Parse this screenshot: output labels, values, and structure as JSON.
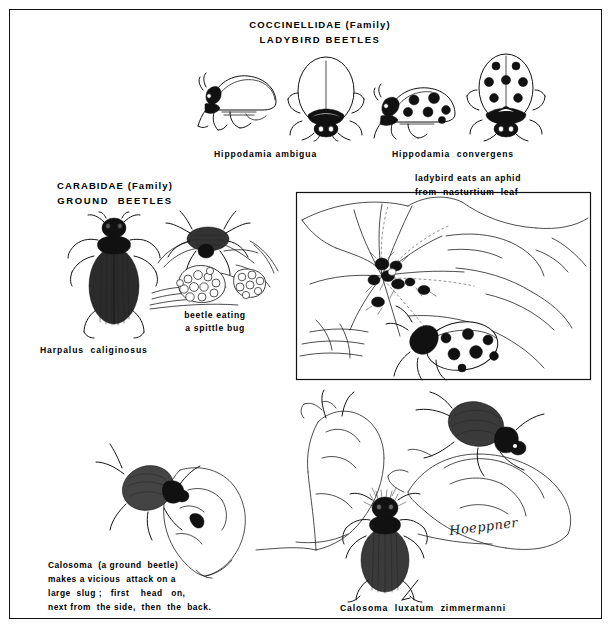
{
  "plate": {
    "medium": "pen-and-ink natural history illustration plate",
    "background_color": "#ffffff",
    "ink_color": "#111111",
    "border": "thin black rectangular frame"
  },
  "headings": {
    "coccinellidae": "COCCINELLIDAE (Family)",
    "ladybird_beetles": "LADYBIRD BEETLES",
    "carabidae": "CARABIDAE (Family)",
    "ground_beetles": "GROUND  BEETLES"
  },
  "species_labels": {
    "hippodamia_ambigua": "Hippodamia ambigua",
    "hippodamia_convergens": "Hippodamia  convergens",
    "harpalus": "Harpalus  caliginosus",
    "calosoma_species": "Calosoma  luxatum  zimmermanni"
  },
  "captions": {
    "aphid_line1": "ladybird eats an aphid",
    "aphid_line2": "from  nasturtium  leaf",
    "spittle_line1": "beetle eating",
    "spittle_line2": "a spittle bug",
    "calosoma_line1": "Calosoma  (a ground  beetle)",
    "calosoma_line2": "makes a vicious  attack on a",
    "calosoma_line3": "large  slug ;   first    head   on,",
    "calosoma_line4": "next from  the side,  then  the  back."
  },
  "signature": {
    "artist": "Hoeppner"
  },
  "figures": [
    {
      "name": "ladybird-lateral-plain",
      "description": "ladybird beetle side view, unspotted elytra, dark head markings"
    },
    {
      "name": "ladybird-dorsal-convergent",
      "description": "ladybird beetle dorsal view, black pronotum, plain elytra with midline"
    },
    {
      "name": "ladybird-lateral-spotted",
      "description": "ladybird beetle side view with large black spots"
    },
    {
      "name": "ladybird-dorsal-spotted",
      "description": "ladybird beetle dorsal view with large black spots"
    },
    {
      "name": "harpalus-dorsal",
      "description": "ground beetle Harpalus caliginosus, dorsal view, striated elytra"
    },
    {
      "name": "beetle-eating-spittle-bug",
      "description": "ground beetle on leaf feeding at a frothy spittle mass"
    },
    {
      "name": "nasturtium-leaf-scene",
      "description": "large round nasturtium leaf with aphid cluster and a spotted ladybird"
    },
    {
      "name": "calosoma-attacking-slug-head",
      "description": "Calosoma beetle attacking slug head on"
    },
    {
      "name": "calosoma-attacking-slug-side",
      "description": "Calosoma beetle attacking slug from the side"
    },
    {
      "name": "calosoma-attacking-slug-back",
      "description": "Calosoma beetle attacking slug from the back"
    },
    {
      "name": "calosoma-dorsal",
      "description": "Calosoma luxatum zimmermanni dorsal view with hairy head"
    }
  ]
}
